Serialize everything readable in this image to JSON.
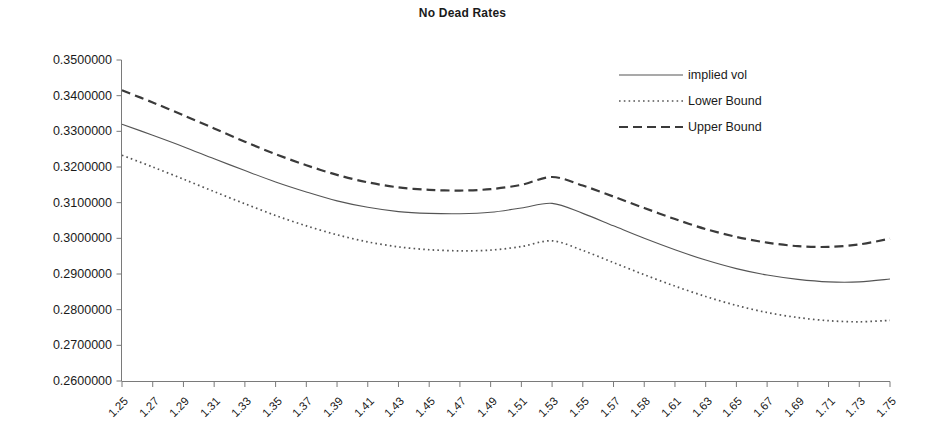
{
  "title": "No Dead Rates",
  "legend": [
    {
      "label": "implied vol",
      "style": "solid",
      "icon": "solid-line-icon"
    },
    {
      "label": "Lower Bound",
      "style": "dotted",
      "icon": "dotted-line-icon"
    },
    {
      "label": "Upper Bound",
      "style": "dashed",
      "icon": "dashed-line-icon"
    }
  ],
  "axis": {
    "y_tick_labels": [
      "0.3500000",
      "0.3400000",
      "0.3300000",
      "0.3200000",
      "0.3100000",
      "0.3000000",
      "0.2900000",
      "0.2800000",
      "0.2700000",
      "0.2600000"
    ],
    "x_tick_labels": [
      "1.25",
      "1.27",
      "1.29",
      "1.31",
      "1.33",
      "1.35",
      "1.37",
      "1.39",
      "1.41",
      "1.43",
      "1.45",
      "1.47",
      "1.49",
      "1.51",
      "1.53",
      "1.55",
      "1.57",
      "1.58",
      "1.61",
      "1.63",
      "1.65",
      "1.67",
      "1.69",
      "1.71",
      "1.73",
      "1.75"
    ]
  },
  "colors": {
    "ink": "#1a1a1a",
    "axis": "#7a7a7a",
    "implied_vol": "#555555",
    "lower_bound": "#555555",
    "upper_bound": "#3a3a3a",
    "background": "#ffffff"
  },
  "chart_data": {
    "type": "line",
    "title": "No Dead Rates",
    "xlabel": "",
    "ylabel": "",
    "xlim": [
      1.25,
      1.75
    ],
    "ylim": [
      0.26,
      0.35
    ],
    "grid": false,
    "legend_position": "top-right",
    "ytick_step": 0.01,
    "categories": [
      "1.25",
      "1.27",
      "1.29",
      "1.31",
      "1.33",
      "1.35",
      "1.37",
      "1.39",
      "1.41",
      "1.43",
      "1.45",
      "1.47",
      "1.49",
      "1.51",
      "1.53",
      "1.55",
      "1.57",
      "1.58",
      "1.61",
      "1.63",
      "1.65",
      "1.67",
      "1.69",
      "1.71",
      "1.73",
      "1.75"
    ],
    "x": [
      1.25,
      1.27,
      1.29,
      1.31,
      1.33,
      1.35,
      1.37,
      1.39,
      1.41,
      1.43,
      1.45,
      1.47,
      1.49,
      1.51,
      1.53,
      1.55,
      1.57,
      1.58,
      1.61,
      1.63,
      1.65,
      1.67,
      1.69,
      1.71,
      1.73,
      1.75
    ],
    "series": [
      {
        "name": "implied vol",
        "style": "solid",
        "values": [
          0.332,
          0.3289,
          0.3257,
          0.3223,
          0.319,
          0.3158,
          0.313,
          0.3105,
          0.3087,
          0.3075,
          0.307,
          0.3069,
          0.3073,
          0.3085,
          0.3098,
          0.307,
          0.3035,
          0.3,
          0.2968,
          0.2939,
          0.2915,
          0.2897,
          0.2885,
          0.2878,
          0.2878,
          0.2886
        ]
      },
      {
        "name": "Lower Bound",
        "style": "dotted",
        "values": [
          0.3233,
          0.32,
          0.3166,
          0.3131,
          0.3097,
          0.3064,
          0.3035,
          0.301,
          0.299,
          0.2976,
          0.2968,
          0.2965,
          0.2967,
          0.2977,
          0.2993,
          0.2966,
          0.2932,
          0.2898,
          0.2866,
          0.2837,
          0.2812,
          0.2792,
          0.2778,
          0.2769,
          0.2766,
          0.277
        ]
      },
      {
        "name": "Upper Bound",
        "style": "dashed",
        "values": [
          0.3415,
          0.3381,
          0.3345,
          0.3308,
          0.3271,
          0.3236,
          0.3205,
          0.3178,
          0.3157,
          0.3143,
          0.3136,
          0.3134,
          0.3138,
          0.315,
          0.3172,
          0.3148,
          0.3117,
          0.3085,
          0.3054,
          0.3026,
          0.3004,
          0.2988,
          0.2978,
          0.2976,
          0.2983,
          0.2999
        ]
      }
    ]
  }
}
